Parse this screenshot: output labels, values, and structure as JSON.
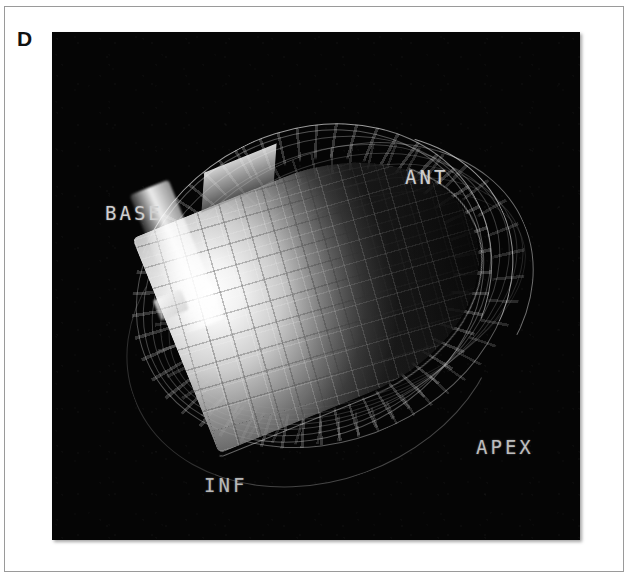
{
  "figure": {
    "panel_letter": "D",
    "modality": "3d-surface-rendering",
    "background_color": "#050505",
    "page_background": "#ffffff",
    "border_color": "#9a9a9a"
  },
  "render": {
    "surface_name": "endocardial-surface",
    "wireframe_name": "epicardial-wireframe",
    "mesh": "grid",
    "shading": "grayscale"
  },
  "orientation_labels": [
    {
      "id": "base",
      "text": "BASE",
      "color": "#cfcfcf"
    },
    {
      "id": "ant",
      "text": "ANT",
      "color": "#cfcfcf"
    },
    {
      "id": "inf",
      "text": "INF",
      "color": "#b8b8b8"
    },
    {
      "id": "apex",
      "text": "APEX",
      "color": "#bdbdbd"
    }
  ]
}
